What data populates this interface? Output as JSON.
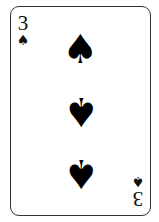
{
  "card": {
    "rank": "3",
    "suit": "spades",
    "suit_glyph": "♠",
    "color": "#000000",
    "pips": [
      {
        "glyph": "♠",
        "inverted": false
      },
      {
        "glyph": "♠",
        "inverted": true
      },
      {
        "glyph": "♠",
        "inverted": true
      }
    ]
  }
}
